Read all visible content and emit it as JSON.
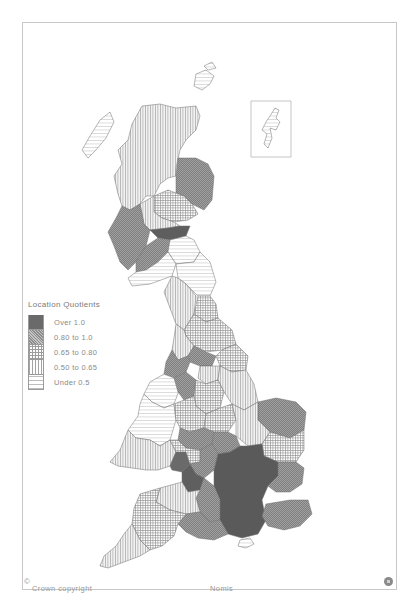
{
  "map": {
    "title": "Location Quotients",
    "copyright": "Crown copyright",
    "copyright_symbol": "©",
    "source": "Nomis",
    "inset_label": "Shetland inset",
    "logo_icon": "nomis-logo-icon"
  },
  "legend": {
    "title": "Location Quotients",
    "items": [
      {
        "label": "Over 1.0",
        "class": "c0",
        "color": "#6a6a6a",
        "pattern": "solid-dark"
      },
      {
        "label": "0.80 to 1.0",
        "class": "c1",
        "color": "#8c8c8c",
        "pattern": "fine-crosshatch"
      },
      {
        "label": "0.65 to 0.80",
        "class": "c2",
        "color": "#9c9c9c",
        "pattern": "grid"
      },
      {
        "label": "0.50 to 0.65",
        "class": "c3",
        "color": "#a4a4a4",
        "pattern": "vertical-lines"
      },
      {
        "label": "Under 0.5",
        "class": "c4",
        "color": "#bdbdbd",
        "pattern": "horizontal-lines"
      }
    ]
  },
  "regions": [
    {
      "name": "Highlands",
      "class": "c3"
    },
    {
      "name": "Western Isles",
      "class": "c4"
    },
    {
      "name": "Orkney",
      "class": "c4"
    },
    {
      "name": "Shetland",
      "class": "c4"
    },
    {
      "name": "Grampian",
      "class": "c1"
    },
    {
      "name": "Tayside",
      "class": "c2"
    },
    {
      "name": "Central/Fife",
      "class": "c3"
    },
    {
      "name": "Strathclyde West",
      "class": "c1"
    },
    {
      "name": "Lothian",
      "class": "c0"
    },
    {
      "name": "Borders",
      "class": "c4"
    },
    {
      "name": "Dumfries and Galloway",
      "class": "c4"
    },
    {
      "name": "Strathclyde South",
      "class": "c1"
    },
    {
      "name": "Northumberland",
      "class": "c4"
    },
    {
      "name": "Cumbria",
      "class": "c3"
    },
    {
      "name": "Tyne and Wear / Durham",
      "class": "c2"
    },
    {
      "name": "North Yorkshire",
      "class": "c2"
    },
    {
      "name": "Lancashire",
      "class": "c3"
    },
    {
      "name": "West Yorkshire",
      "class": "c1"
    },
    {
      "name": "Humberside",
      "class": "c2"
    },
    {
      "name": "Greater Manchester / Merseyside",
      "class": "c1"
    },
    {
      "name": "South Yorkshire",
      "class": "c3"
    },
    {
      "name": "Lincolnshire",
      "class": "c3"
    },
    {
      "name": "North Wales",
      "class": "c4"
    },
    {
      "name": "Cheshire",
      "class": "c1"
    },
    {
      "name": "Derbyshire / Notts",
      "class": "c2"
    },
    {
      "name": "Norfolk",
      "class": "c1"
    },
    {
      "name": "Mid Wales",
      "class": "c4"
    },
    {
      "name": "Shropshire / Staffs",
      "class": "c2"
    },
    {
      "name": "Leicestershire",
      "class": "c2"
    },
    {
      "name": "Cambridgeshire",
      "class": "c3"
    },
    {
      "name": "Suffolk",
      "class": "c2"
    },
    {
      "name": "West Midlands",
      "class": "c1"
    },
    {
      "name": "Northamptonshire",
      "class": "c1"
    },
    {
      "name": "South Wales",
      "class": "c3"
    },
    {
      "name": "Gwent / Glamorgan coast",
      "class": "c0"
    },
    {
      "name": "Hereford / Worcester",
      "class": "c2"
    },
    {
      "name": "Gloucestershire",
      "class": "c1"
    },
    {
      "name": "Avon",
      "class": "c0"
    },
    {
      "name": "South East core",
      "class": "c0"
    },
    {
      "name": "Essex",
      "class": "c1"
    },
    {
      "name": "Kent",
      "class": "c1"
    },
    {
      "name": "Wiltshire",
      "class": "c1"
    },
    {
      "name": "Somerset",
      "class": "c3"
    },
    {
      "name": "Dorset / Hampshire west",
      "class": "c1"
    },
    {
      "name": "Devon",
      "class": "c2"
    },
    {
      "name": "Cornwall",
      "class": "c3"
    },
    {
      "name": "Isle of Wight",
      "class": "c4"
    }
  ]
}
